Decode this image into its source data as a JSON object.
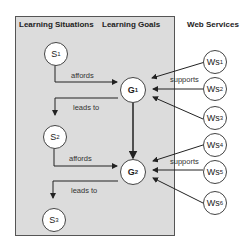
{
  "headers": {
    "situations": "Learning Situations",
    "goals": "Learning Goals",
    "services": "Web Services"
  },
  "situations": [
    {
      "base": "S",
      "sub": "1"
    },
    {
      "base": "S",
      "sub": "2"
    },
    {
      "base": "S",
      "sub": "3"
    }
  ],
  "goals": [
    {
      "base": "G",
      "sub": "1"
    },
    {
      "base": "G",
      "sub": "2"
    }
  ],
  "services": [
    {
      "base": "Ws",
      "sub": "1"
    },
    {
      "base": "Ws",
      "sub": "2"
    },
    {
      "base": "Ws",
      "sub": "3"
    },
    {
      "base": "Ws",
      "sub": "4"
    },
    {
      "base": "Ws",
      "sub": "5"
    },
    {
      "base": "Ws",
      "sub": "6"
    }
  ],
  "edge_labels": {
    "affords_1": "affords",
    "leads_to_1": "leads to",
    "affords_2": "affords",
    "leads_to_2": "leads to",
    "supports_1": "supports",
    "supports_2": "supports"
  },
  "colors": {
    "panel_bg": "#dcdcdc",
    "node_bg": "#ffffff",
    "stroke": "#333333"
  }
}
